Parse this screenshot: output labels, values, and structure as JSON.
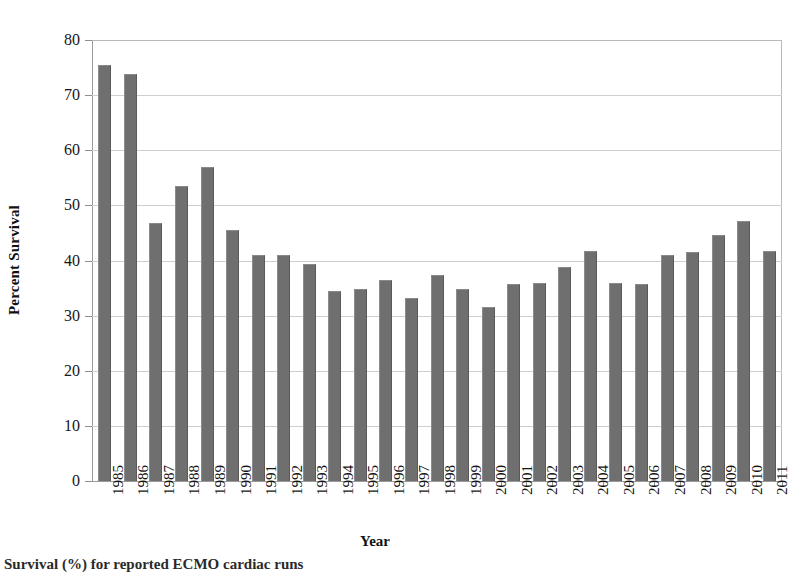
{
  "chart_data": {
    "type": "bar",
    "title": "",
    "xlabel": "Year",
    "ylabel": "Percent Survival",
    "ylim": [
      0,
      80
    ],
    "ytick_step": 10,
    "yticks": [
      80,
      70,
      60,
      50,
      40,
      30,
      20,
      10,
      0
    ],
    "grid": "horizontal",
    "legend": "none",
    "bar_color": "#6f6f6f",
    "gridline_color": "#cfcfcf",
    "axis_color": "#9a9a9a",
    "categories": [
      "1985",
      "1986",
      "1987",
      "1988",
      "1989",
      "1990",
      "1991",
      "1992",
      "1993",
      "1994",
      "1995",
      "1996",
      "1997",
      "1998",
      "1999",
      "2000",
      "2001",
      "2002",
      "2003",
      "2004",
      "2005",
      "2006",
      "2007",
      "2008",
      "2009",
      "2010",
      "2011"
    ],
    "values": [
      75.5,
      73.9,
      46.8,
      53.5,
      57.0,
      45.6,
      41.0,
      41.0,
      39.4,
      34.4,
      34.8,
      36.5,
      33.2,
      37.4,
      34.9,
      31.6,
      35.8,
      36.0,
      38.8,
      41.7,
      35.9,
      35.7,
      41.0,
      41.5,
      44.6,
      47.2,
      41.8
    ],
    "series": [
      {
        "name": "Percent Survival",
        "values": [
          75.5,
          73.9,
          46.8,
          53.5,
          57.0,
          45.6,
          41.0,
          41.0,
          39.4,
          34.4,
          34.8,
          36.5,
          33.2,
          37.4,
          34.9,
          31.6,
          35.8,
          36.0,
          38.8,
          41.7,
          35.9,
          35.7,
          41.0,
          41.5,
          44.6,
          47.2,
          41.8
        ]
      }
    ]
  },
  "caption": {
    "text": "Survival (%) for reported ECMO cardiac runs"
  }
}
